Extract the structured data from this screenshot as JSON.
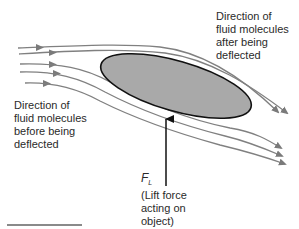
{
  "diagram": {
    "labels": {
      "after": [
        "Direction of",
        "fluid molecules",
        "after being",
        "deflected"
      ],
      "before": [
        "Direction of",
        "fluid molecules",
        "before being",
        "deflected"
      ],
      "lift_symbol": "F",
      "lift_subscript": "L",
      "lift_desc": [
        "(Lift force",
        "acting on",
        "object)"
      ]
    },
    "colors": {
      "streamline": "#808080",
      "object_fill": "#a9a9a9",
      "object_outline": "#111111",
      "lift_arrow": "#111111",
      "bottom_rule": "#8a8a8a"
    },
    "object": {
      "shape": "ellipse",
      "cx": 176,
      "cy": 86,
      "rx": 78,
      "ry": 25,
      "rotation_deg": 16
    },
    "streamlines_count": 5,
    "streamlines_over_object": 2,
    "streamlines_under_object": 3
  }
}
